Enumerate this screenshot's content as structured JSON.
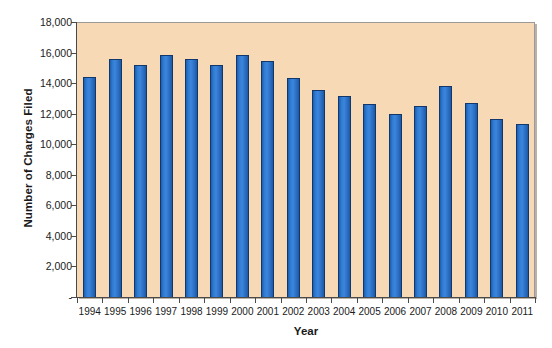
{
  "chart_data": {
    "type": "bar",
    "title": "",
    "xlabel": "Year",
    "ylabel": "Number of Charges Filed",
    "categories": [
      "1994",
      "1995",
      "1996",
      "1997",
      "1998",
      "1999",
      "2000",
      "2001",
      "2002",
      "2003",
      "2004",
      "2005",
      "2006",
      "2007",
      "2008",
      "2009",
      "2010",
      "2011"
    ],
    "values": [
      14400,
      15550,
      15200,
      15850,
      15600,
      15200,
      15850,
      15450,
      14350,
      13550,
      13150,
      12650,
      12000,
      12500,
      13800,
      12700,
      11650,
      11350
    ],
    "ylim": [
      0,
      18000
    ],
    "ytick_values": [
      0,
      2000,
      4000,
      6000,
      8000,
      10000,
      12000,
      14000,
      16000,
      18000
    ],
    "ytick_labels": [
      "-",
      "2,000",
      "4,000",
      "6,000",
      "8,000",
      "10,000",
      "12,000",
      "14,000",
      "16,000",
      "18,000"
    ],
    "grid": false,
    "legend": false,
    "legend_position": "none",
    "series": [
      {
        "name": "Number of Charges Filed",
        "values": [
          14400,
          15550,
          15200,
          15850,
          15600,
          15200,
          15850,
          15450,
          14350,
          13550,
          13150,
          12650,
          12000,
          12500,
          13800,
          12700,
          11650,
          11350
        ]
      }
    ],
    "colors": {
      "bar_fill": "#2f7ad2",
      "bar_border": "#12386b",
      "plot_background": "#f7d9b5",
      "axis": "#4a4a4a",
      "text": "#1a1a1a"
    }
  }
}
